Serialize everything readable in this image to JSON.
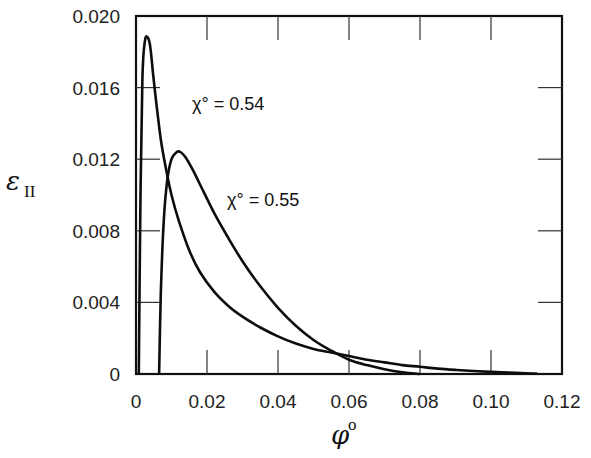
{
  "chart_data": {
    "type": "line",
    "title": "",
    "xlabel": "φ°",
    "ylabel": "ε_II",
    "xlim": [
      0,
      0.12
    ],
    "ylim": [
      0,
      0.02
    ],
    "grid": false,
    "legend": "none (curves labeled inline)",
    "x_ticks": [
      "0",
      "0.02",
      "0.04",
      "0.06",
      "0.08",
      "0.10",
      "0.12"
    ],
    "y_ticks": [
      "0",
      "0.004",
      "0.008",
      "0.012",
      "0.016",
      "0.020"
    ],
    "series": [
      {
        "name": "χ° = 0.54",
        "x": [
          0.0008,
          0.0012,
          0.0018,
          0.0025,
          0.0033,
          0.004,
          0.0048,
          0.0058,
          0.007,
          0.0085,
          0.01,
          0.012,
          0.015,
          0.018,
          0.022,
          0.026,
          0.03,
          0.035,
          0.04,
          0.045,
          0.05,
          0.055,
          0.06,
          0.065,
          0.07,
          0.075,
          0.08,
          0.085,
          0.09,
          0.095,
          0.1,
          0.105,
          0.11,
          0.113
        ],
        "y": [
          0.0,
          0.009,
          0.0165,
          0.0186,
          0.0188,
          0.0183,
          0.0168,
          0.015,
          0.0131,
          0.0114,
          0.01,
          0.0086,
          0.0069,
          0.0057,
          0.0046,
          0.0038,
          0.0032,
          0.0026,
          0.0021,
          0.0017,
          0.0014,
          0.0012,
          0.001,
          0.0008,
          0.00065,
          0.0005,
          0.0004,
          0.0003,
          0.00023,
          0.00017,
          0.00012,
          8e-05,
          4e-05,
          2e-05
        ]
      },
      {
        "name": "χ° = 0.55",
        "x": [
          0.0065,
          0.007,
          0.0078,
          0.0088,
          0.01,
          0.0115,
          0.0125,
          0.014,
          0.016,
          0.019,
          0.022,
          0.026,
          0.03,
          0.035,
          0.04,
          0.045,
          0.05,
          0.055,
          0.06,
          0.065,
          0.07,
          0.075,
          0.08
        ],
        "y": [
          0.0,
          0.0045,
          0.0085,
          0.0108,
          0.012,
          0.0124,
          0.0124,
          0.0121,
          0.0114,
          0.0102,
          0.009,
          0.0076,
          0.0063,
          0.0049,
          0.0037,
          0.0027,
          0.0019,
          0.0013,
          0.0008,
          0.0005,
          0.00027,
          0.0001,
          0.0
        ]
      }
    ],
    "annotations": [
      {
        "text": "χ° = 0.54",
        "near_x": 0.006,
        "near_y": 0.0165
      },
      {
        "text": "χ° = 0.55",
        "near_x": 0.026,
        "near_y": 0.0083
      }
    ]
  },
  "labels": {
    "ylabel_main": "ε",
    "ylabel_sub": "II",
    "xlabel_main": "φ",
    "xlabel_sup": "o",
    "anno1": "χ° = 0.54",
    "anno2": "χ° = 0.55"
  }
}
